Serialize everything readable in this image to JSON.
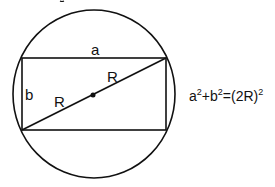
{
  "diagram": {
    "labels": {
      "top_side": "a",
      "left_side": "b",
      "radius_upper": "R",
      "radius_lower": "R"
    },
    "equation": {
      "base1": "a",
      "exp1": "2",
      "plus": "+b",
      "exp2": "2",
      "rhs": "=(2R)",
      "exp3": "2",
      "full": "a^2+b^2=(2R)^2"
    },
    "colors": {
      "stroke": "#111111",
      "background": "#ffffff"
    },
    "geometry": {
      "circle": {
        "cx": 94,
        "cy": 94,
        "rx": 81,
        "ry": 84
      },
      "rectangle": {
        "x": 22,
        "y": 58,
        "width": 144,
        "height": 72
      },
      "diagonal": {
        "x1": 22,
        "y1": 130,
        "x2": 166,
        "y2": 58
      },
      "center_dot": {
        "cx": 93,
        "cy": 95,
        "r": 2.5
      }
    }
  }
}
